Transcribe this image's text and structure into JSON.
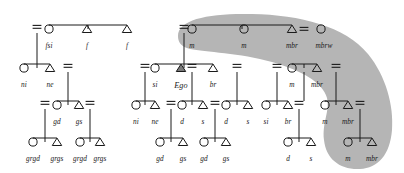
{
  "diagram": {
    "type": "genealogical-kinship-diagram",
    "colors": {
      "line": "#1a1a1a",
      "shading": "#b5b5b5",
      "ego_fill": "#7a7a7a",
      "background": "#ffffff",
      "label": "#1a1a1a"
    },
    "symbols": {
      "female": "circle",
      "male": "triangle",
      "ego": "filled-triangle",
      "marriage": "double-bar",
      "descent": "vertical-line"
    },
    "shaded_group_label": "matrilineal descent group"
  },
  "nodes": [
    {
      "id": "n1",
      "label": "fsi",
      "sex": "female",
      "x": 49,
      "y": 29,
      "lx": 49,
      "ly": 42
    },
    {
      "id": "n2",
      "label": "f",
      "sex": "male",
      "x": 87,
      "y": 29,
      "lx": 87,
      "ly": 42
    },
    {
      "id": "n3",
      "label": "f",
      "sex": "male",
      "x": 127,
      "y": 29,
      "lx": 127,
      "ly": 42
    },
    {
      "id": "n4",
      "label": "ni",
      "sex": "female",
      "x": 24,
      "y": 68,
      "lx": 24,
      "ly": 81
    },
    {
      "id": "n5",
      "label": "ne",
      "sex": "male",
      "x": 50,
      "y": 68,
      "lx": 50,
      "ly": 81
    },
    {
      "id": "n6",
      "label": "gd",
      "sex": "female",
      "x": 57,
      "y": 105,
      "lx": 57,
      "ly": 118
    },
    {
      "id": "n7",
      "label": "gs",
      "sex": "male",
      "x": 79,
      "y": 105,
      "lx": 79,
      "ly": 118
    },
    {
      "id": "n8",
      "label": "grgd",
      "sex": "female",
      "x": 33,
      "y": 142,
      "lx": 33,
      "ly": 155
    },
    {
      "id": "n9",
      "label": "grgs",
      "sex": "male",
      "x": 57,
      "y": 142,
      "lx": 57,
      "ly": 155
    },
    {
      "id": "n10",
      "label": "grgd",
      "sex": "female",
      "x": 80,
      "y": 142,
      "lx": 80,
      "ly": 155
    },
    {
      "id": "n11",
      "label": "grgs",
      "sex": "male",
      "x": 100,
      "y": 142,
      "lx": 100,
      "ly": 155
    },
    {
      "id": "n12",
      "label": "m",
      "sex": "female",
      "x": 192,
      "y": 29,
      "lx": 192,
      "ly": 42
    },
    {
      "id": "n13",
      "label": "m",
      "sex": "female",
      "x": 244,
      "y": 29,
      "lx": 244,
      "ly": 42
    },
    {
      "id": "n14",
      "label": "mbr",
      "sex": "male",
      "x": 292,
      "y": 29,
      "lx": 292,
      "ly": 42
    },
    {
      "id": "n15",
      "label": "mbrw",
      "sex": "female",
      "x": 321,
      "y": 29,
      "lx": 324,
      "ly": 42
    },
    {
      "id": "n16",
      "label": "si",
      "sex": "female",
      "x": 155,
      "y": 68,
      "lx": 155,
      "ly": 81
    },
    {
      "id": "n17",
      "label": "Ego",
      "sex": "ego",
      "x": 181,
      "y": 68,
      "lx": 181,
      "ly": 82
    },
    {
      "id": "n18",
      "label": "br",
      "sex": "male",
      "x": 213,
      "y": 68,
      "lx": 213,
      "ly": 81
    },
    {
      "id": "n19",
      "label": "m",
      "sex": "female",
      "x": 292,
      "y": 68,
      "lx": 292,
      "ly": 81
    },
    {
      "id": "n20",
      "label": "mbr",
      "sex": "male",
      "x": 317,
      "y": 68,
      "lx": 317,
      "ly": 81
    },
    {
      "id": "n21",
      "label": "ni",
      "sex": "female",
      "x": 136,
      "y": 105,
      "lx": 136,
      "ly": 118
    },
    {
      "id": "n22",
      "label": "ne",
      "sex": "male",
      "x": 155,
      "y": 105,
      "lx": 155,
      "ly": 118
    },
    {
      "id": "n23",
      "label": "d",
      "sex": "female",
      "x": 182,
      "y": 105,
      "lx": 182,
      "ly": 118
    },
    {
      "id": "n24",
      "label": "s",
      "sex": "male",
      "x": 203,
      "y": 105,
      "lx": 203,
      "ly": 118
    },
    {
      "id": "n25",
      "label": "d",
      "sex": "female",
      "x": 226,
      "y": 105,
      "lx": 226,
      "ly": 118
    },
    {
      "id": "n26",
      "label": "s",
      "sex": "male",
      "x": 248,
      "y": 105,
      "lx": 248,
      "ly": 118
    },
    {
      "id": "n27",
      "label": "si",
      "sex": "female",
      "x": 266,
      "y": 105,
      "lx": 266,
      "ly": 118
    },
    {
      "id": "n28",
      "label": "br",
      "sex": "male",
      "x": 288,
      "y": 105,
      "lx": 288,
      "ly": 118
    },
    {
      "id": "n29",
      "label": "m",
      "sex": "female",
      "x": 325,
      "y": 105,
      "lx": 325,
      "ly": 118
    },
    {
      "id": "n30",
      "label": "mbr",
      "sex": "male",
      "x": 348,
      "y": 105,
      "lx": 348,
      "ly": 118
    },
    {
      "id": "n31",
      "label": "gd",
      "sex": "female",
      "x": 160,
      "y": 142,
      "lx": 160,
      "ly": 155
    },
    {
      "id": "n32",
      "label": "gs",
      "sex": "male",
      "x": 183,
      "y": 142,
      "lx": 183,
      "ly": 155
    },
    {
      "id": "n33",
      "label": "gd",
      "sex": "female",
      "x": 204,
      "y": 142,
      "lx": 204,
      "ly": 155
    },
    {
      "id": "n34",
      "label": "gs",
      "sex": "male",
      "x": 226,
      "y": 142,
      "lx": 226,
      "ly": 155
    },
    {
      "id": "n35",
      "label": "d",
      "sex": "female",
      "x": 288,
      "y": 142,
      "lx": 288,
      "ly": 155
    },
    {
      "id": "n36",
      "label": "s",
      "sex": "male",
      "x": 311,
      "y": 142,
      "lx": 311,
      "ly": 155
    },
    {
      "id": "n37",
      "label": "m",
      "sex": "female",
      "x": 348,
      "y": 142,
      "lx": 348,
      "ly": 155
    },
    {
      "id": "n38",
      "label": "mbr",
      "sex": "male",
      "x": 372,
      "y": 142,
      "lx": 372,
      "ly": 155
    }
  ],
  "sibling_bars": [
    {
      "id": "b1",
      "x1": 49,
      "x2": 127,
      "y": 25
    },
    {
      "id": "b2",
      "x1": 24,
      "x2": 50,
      "y": 64
    },
    {
      "id": "b3",
      "x1": 57,
      "x2": 79,
      "y": 101
    },
    {
      "id": "b4",
      "x1": 33,
      "x2": 57,
      "y": 138
    },
    {
      "id": "b5",
      "x1": 80,
      "x2": 100,
      "y": 138
    },
    {
      "id": "b6",
      "x1": 192,
      "x2": 292,
      "y": 25
    },
    {
      "id": "b7",
      "x1": 155,
      "x2": 213,
      "y": 64
    },
    {
      "id": "b8",
      "x1": 292,
      "x2": 317,
      "y": 64
    },
    {
      "id": "b9",
      "x1": 136,
      "x2": 155,
      "y": 101
    },
    {
      "id": "b10",
      "x1": 182,
      "x2": 203,
      "y": 101
    },
    {
      "id": "b11",
      "x1": 226,
      "x2": 248,
      "y": 101
    },
    {
      "id": "b12",
      "x1": 266,
      "x2": 288,
      "y": 101
    },
    {
      "id": "b13",
      "x1": 325,
      "x2": 348,
      "y": 101
    },
    {
      "id": "b14",
      "x1": 160,
      "x2": 183,
      "y": 138
    },
    {
      "id": "b15",
      "x1": 204,
      "x2": 226,
      "y": 138
    },
    {
      "id": "b16",
      "x1": 288,
      "x2": 311,
      "y": 138
    },
    {
      "id": "b17",
      "x1": 348,
      "x2": 372,
      "y": 138
    }
  ],
  "descent_lines": [
    {
      "id": "d1",
      "x": 88,
      "y1": 25,
      "y2": 29
    },
    {
      "id": "d2",
      "x": 37,
      "y1": 64,
      "y2": 68
    },
    {
      "id": "d3",
      "x": 68,
      "y1": 101,
      "y2": 105
    },
    {
      "id": "d4",
      "x": 45,
      "y1": 138,
      "y2": 142
    },
    {
      "id": "d5",
      "x": 90,
      "y1": 138,
      "y2": 142
    },
    {
      "id": "d6",
      "x": 242,
      "y1": 25,
      "y2": 29
    },
    {
      "id": "d7",
      "x": 184,
      "y1": 64,
      "y2": 68
    },
    {
      "id": "d8",
      "x": 304,
      "y1": 64,
      "y2": 68
    },
    {
      "id": "d9",
      "x": 145,
      "y1": 101,
      "y2": 105
    },
    {
      "id": "d10",
      "x": 192,
      "y1": 101,
      "y2": 105
    },
    {
      "id": "d11",
      "x": 237,
      "y1": 101,
      "y2": 105
    },
    {
      "id": "d12",
      "x": 277,
      "y1": 101,
      "y2": 105
    },
    {
      "id": "d13",
      "x": 336,
      "y1": 101,
      "y2": 105
    },
    {
      "id": "d14",
      "x": 171,
      "y1": 138,
      "y2": 142
    },
    {
      "id": "d15",
      "x": 215,
      "y1": 138,
      "y2": 142
    },
    {
      "id": "d16",
      "x": 299,
      "y1": 138,
      "y2": 142
    },
    {
      "id": "d17",
      "x": 360,
      "y1": 138,
      "y2": 142
    }
  ],
  "parent_links": [
    {
      "id": "p1",
      "x": 37,
      "y1": 33,
      "y2": 64
    },
    {
      "id": "p2",
      "x": 68,
      "y1": 72,
      "y2": 101
    },
    {
      "id": "p3",
      "x": 45,
      "y1": 109,
      "y2": 138
    },
    {
      "id": "p4",
      "x": 90,
      "y1": 109,
      "y2": 138
    },
    {
      "id": "p5",
      "x": 184,
      "y1": 33,
      "y2": 64
    },
    {
      "id": "p6",
      "x": 145,
      "y1": 72,
      "y2": 101
    },
    {
      "id": "p7",
      "x": 192,
      "y1": 72,
      "y2": 101
    },
    {
      "id": "p8",
      "x": 237,
      "y1": 72,
      "y2": 101
    },
    {
      "id": "p9",
      "x": 277,
      "y1": 72,
      "y2": 101
    },
    {
      "id": "p10",
      "x": 304,
      "y1": 72,
      "y2": 101
    },
    {
      "id": "p11",
      "x": 336,
      "y1": 72,
      "y2": 101
    },
    {
      "id": "p12",
      "x": 171,
      "y1": 109,
      "y2": 138
    },
    {
      "id": "p13",
      "x": 215,
      "y1": 109,
      "y2": 138
    },
    {
      "id": "p14",
      "x": 299,
      "y1": 109,
      "y2": 138
    },
    {
      "id": "p15",
      "x": 360,
      "y1": 109,
      "y2": 138
    }
  ],
  "marriage_bars": [
    {
      "id": "m1",
      "x": 37,
      "y": 27
    },
    {
      "id": "m2",
      "x": 68,
      "y": 66
    },
    {
      "id": "m3",
      "x": 45,
      "y": 103
    },
    {
      "id": "m4",
      "x": 90,
      "y": 103
    },
    {
      "id": "m5",
      "x": 184,
      "y": 27
    },
    {
      "id": "m6",
      "x": 304,
      "y": 29
    },
    {
      "id": "m7",
      "x": 145,
      "y": 66
    },
    {
      "id": "m8",
      "x": 192,
      "y": 66
    },
    {
      "id": "m9",
      "x": 237,
      "y": 66
    },
    {
      "id": "m10",
      "x": 277,
      "y": 66
    },
    {
      "id": "m11",
      "x": 336,
      "y": 66
    },
    {
      "id": "m12",
      "x": 171,
      "y": 103
    },
    {
      "id": "m13",
      "x": 215,
      "y": 103
    },
    {
      "id": "m14",
      "x": 299,
      "y": 103
    },
    {
      "id": "m15",
      "x": 360,
      "y": 103
    }
  ],
  "shading": {
    "name": "matrilineal-descent-band",
    "color": "#b5b5b5",
    "opacity": 1
  }
}
